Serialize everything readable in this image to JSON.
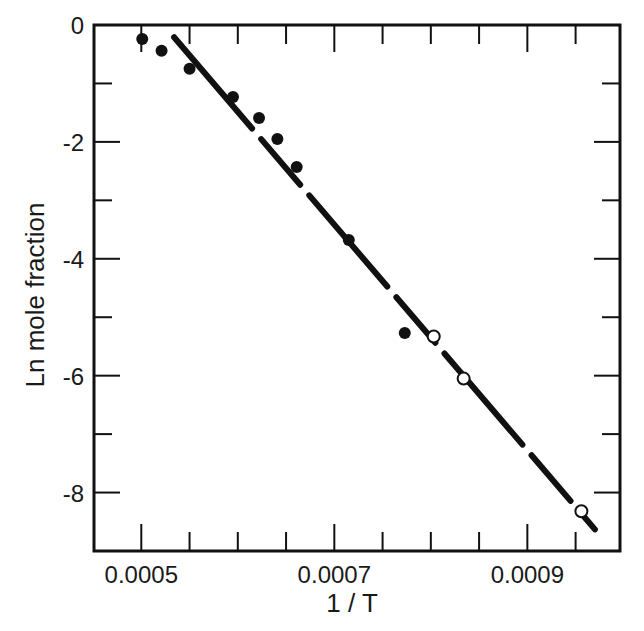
{
  "chart_data": {
    "type": "scatter",
    "title": "",
    "xlabel": "1 / T",
    "ylabel": "Ln mole fraction",
    "xlim": [
      0.000451,
      0.000996
    ],
    "ylim": [
      -9,
      0
    ],
    "x_ticks_major": [
      0.0005,
      0.0007,
      0.0009
    ],
    "x_tick_labels": [
      "0.0005",
      "0.0007",
      "0.0009"
    ],
    "x_ticks_minor": [
      0.00055,
      0.0006,
      0.00065,
      0.00075,
      0.0008,
      0.00085,
      0.00095
    ],
    "y_ticks_major": [
      0,
      -2,
      -4,
      -6,
      -8
    ],
    "y_tick_labels": [
      "0",
      "-2",
      "-4",
      "-6",
      "-8"
    ],
    "y_ticks_minor": [
      -1,
      -3,
      -5,
      -7
    ],
    "grid": false,
    "legend": null,
    "series": [
      {
        "name": "filled circles",
        "marker": "filled-circle",
        "color": "#111111",
        "x": [
          0.000501,
          0.000521,
          0.00055,
          0.000595,
          0.000622,
          0.000641,
          0.000661,
          0.000715,
          0.000773
        ],
        "y": [
          -0.24,
          -0.44,
          -0.75,
          -1.23,
          -1.59,
          -1.95,
          -2.43,
          -3.68,
          -5.27
        ]
      },
      {
        "name": "open circles",
        "marker": "open-circle",
        "color": "#111111",
        "x": [
          0.000803,
          0.000834,
          0.000956
        ],
        "y": [
          -5.33,
          -6.05,
          -8.32
        ]
      },
      {
        "name": "linear fit",
        "type": "line",
        "style": "dashed (long dashes)",
        "color": "#111111",
        "x": [
          0.000534,
          0.00097
        ],
        "y": [
          -0.21,
          -8.63
        ]
      }
    ]
  },
  "colors": {
    "ink": "#111111",
    "background": "#ffffff"
  }
}
